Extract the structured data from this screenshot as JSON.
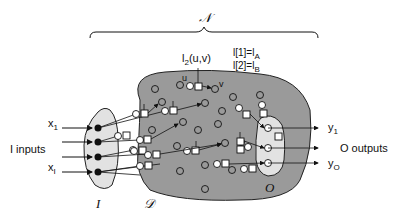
{
  "diagram": {
    "title_symbol": "𝒩",
    "labels": {
      "N": "𝒩",
      "I_set": "I",
      "D_set": "𝒟",
      "O_set": "O",
      "inputs": "I inputs",
      "outputs": "O outputs",
      "x_first": "x",
      "x_first_sub": "1",
      "x_last": "x",
      "x_last_sub": "I",
      "y_first": "y",
      "y_first_sub": "1",
      "y_last": "y",
      "y_last_sub": "O",
      "link_label": "l",
      "link_label_sub": "2",
      "link_label_args": "(u,v)",
      "node_u": "u",
      "node_v": "v",
      "eq1": "l[1]=l",
      "eq1_sub": "A",
      "eq2": "l[2]=l",
      "eq2_sub": "B"
    },
    "colors": {
      "region_fill": "#9a9a9a",
      "subregion_fill": "#e2e2e2",
      "stroke": "#111111"
    }
  }
}
